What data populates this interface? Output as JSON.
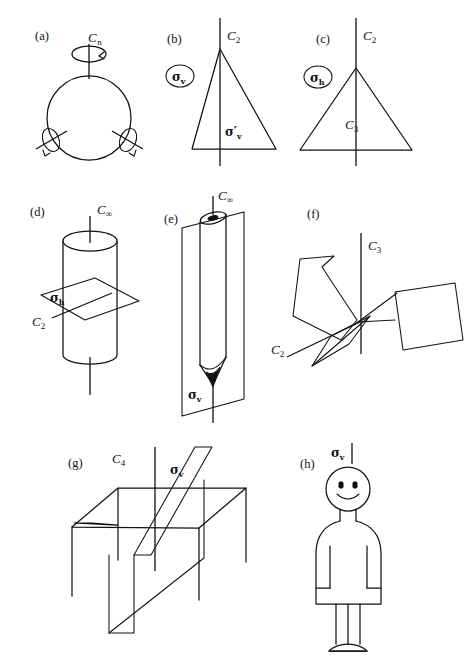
{
  "figure": {
    "stroke_color": "#111111",
    "background_color": "#ffffff",
    "panels": [
      {
        "id": "a",
        "tag": "(a)",
        "object": "sphere",
        "labels": [
          {
            "name": "cn-axis-label",
            "base": "C",
            "sub": "n",
            "text": "Cn"
          }
        ]
      },
      {
        "id": "b",
        "tag": "(b)",
        "object": "isoceles-triangle",
        "labels": [
          {
            "name": "c2-axis-label",
            "base": "C",
            "sub": "2",
            "text": "C2"
          },
          {
            "name": "sigma-v-circled-label",
            "base": "σ",
            "sub": "v",
            "text": "σv"
          },
          {
            "name": "sigma-v-prime-label",
            "base": "σ′",
            "sub": "v",
            "text": "σ′v"
          }
        ]
      },
      {
        "id": "c",
        "tag": "(c)",
        "object": "equilateral-triangle",
        "labels": [
          {
            "name": "c2-axis-label",
            "base": "C",
            "sub": "2",
            "text": "C2"
          },
          {
            "name": "sigma-h-circled-label",
            "base": "σ",
            "sub": "h",
            "text": "σh"
          },
          {
            "name": "c3-axis-label",
            "base": "C",
            "sub": "3",
            "text": "C3"
          }
        ]
      },
      {
        "id": "d",
        "tag": "(d)",
        "object": "cylinder",
        "labels": [
          {
            "name": "c-infinity-axis-label",
            "base": "C",
            "sub": "∞",
            "text": "C∞"
          },
          {
            "name": "sigma-h-label",
            "base": "σ",
            "sub": "h",
            "text": "σh"
          },
          {
            "name": "c2-axis-label",
            "base": "C",
            "sub": "2",
            "text": "C2"
          }
        ]
      },
      {
        "id": "e",
        "tag": "(e)",
        "object": "pencil-cone",
        "labels": [
          {
            "name": "c-infinity-axis-label",
            "base": "C",
            "sub": "∞",
            "text": "C∞"
          },
          {
            "name": "sigma-v-label",
            "base": "σ",
            "sub": "v",
            "text": "σv"
          }
        ]
      },
      {
        "id": "f",
        "tag": "(f)",
        "object": "three-bladed-propeller",
        "labels": [
          {
            "name": "c3-axis-label",
            "base": "C",
            "sub": "3",
            "text": "C3"
          },
          {
            "name": "c2-axis-label",
            "base": "C",
            "sub": "2",
            "text": "C2"
          }
        ]
      },
      {
        "id": "g",
        "tag": "(g)",
        "object": "square-table",
        "labels": [
          {
            "name": "c4-axis-label",
            "base": "C",
            "sub": "4",
            "text": "C4"
          },
          {
            "name": "sigma-v-label",
            "base": "σ",
            "sub": "v",
            "text": "σv"
          }
        ]
      },
      {
        "id": "h",
        "tag": "(h)",
        "object": "human-figure",
        "labels": [
          {
            "name": "sigma-v-label",
            "base": "σ",
            "sub": "v",
            "text": "σv"
          }
        ]
      }
    ]
  }
}
